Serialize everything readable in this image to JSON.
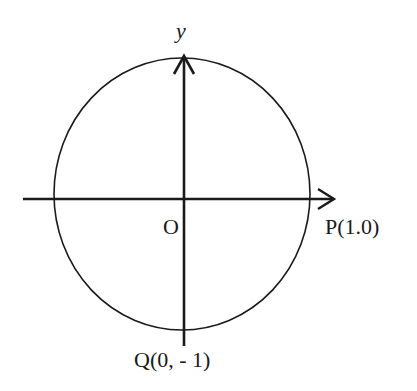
{
  "diagram": {
    "type": "unit-circle-coordinate-axes",
    "labels": {
      "y_axis": "y",
      "origin": "O",
      "point_p": "P(1.0)",
      "point_q": "Q(0, - 1)"
    },
    "colors": {
      "stroke": "#1a1a1a",
      "background": "#ffffff"
    }
  }
}
